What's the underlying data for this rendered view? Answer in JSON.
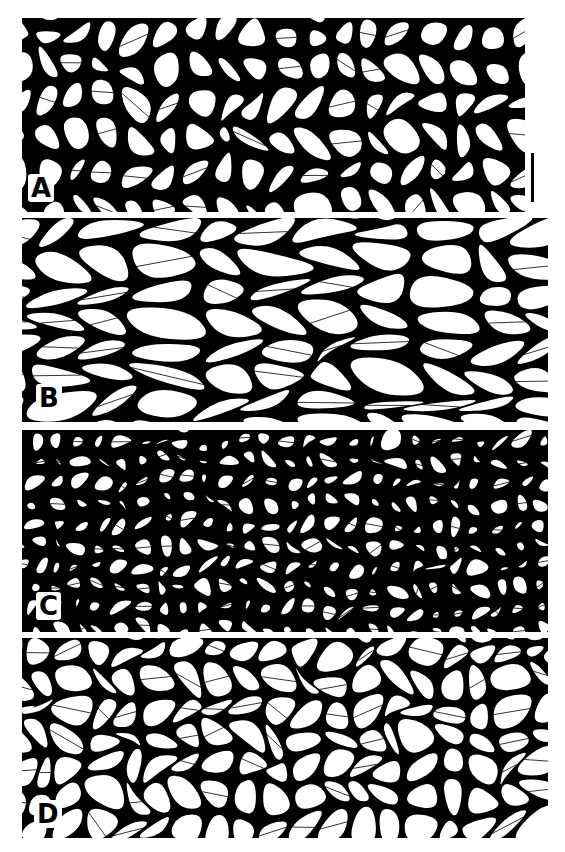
{
  "figure": {
    "background": "#ffffff",
    "wall_color": "#000000",
    "cell_color": "#ffffff",
    "panels": [
      {
        "id": "A",
        "label": "A",
        "x": 22,
        "y": 18,
        "w": 503,
        "h": 194,
        "cell_size": 30,
        "wall": 4.5,
        "jitter": 0.42,
        "stretch_x": 1.0,
        "stretch_y": 1.15,
        "seed": 11,
        "label_x": 28,
        "label_y": 174
      },
      {
        "id": "B",
        "label": "B",
        "x": 22,
        "y": 218,
        "w": 526,
        "h": 204,
        "cell_size": 36,
        "wall": 2.6,
        "jitter": 0.38,
        "stretch_x": 1.5,
        "stretch_y": 0.8,
        "seed": 23,
        "label_x": 36,
        "label_y": 384
      },
      {
        "id": "C",
        "label": "C",
        "x": 22,
        "y": 430,
        "w": 526,
        "h": 202,
        "cell_size": 21,
        "wall": 5.5,
        "jitter": 0.45,
        "stretch_x": 1.0,
        "stretch_y": 1.0,
        "seed": 37,
        "label_x": 36,
        "label_y": 592
      },
      {
        "id": "D",
        "label": "D",
        "x": 22,
        "y": 638,
        "w": 526,
        "h": 200,
        "cell_size": 29,
        "wall": 2.8,
        "jitter": 0.44,
        "stretch_x": 1.0,
        "stretch_y": 1.0,
        "seed": 53,
        "label_x": 34,
        "label_y": 800
      }
    ],
    "scale_bar": {
      "x": 531,
      "y": 153,
      "w": 3,
      "h": 49
    }
  }
}
